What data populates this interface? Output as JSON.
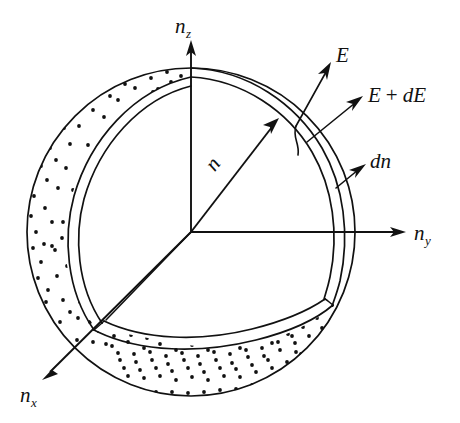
{
  "figure": {
    "background_color": "#ffffff",
    "ink_color": "#111111"
  },
  "axes": [
    {
      "id": "nz",
      "base": "n",
      "subscript": "z",
      "direction": "up",
      "label_x": 189,
      "label_y": 30
    },
    {
      "id": "ny",
      "base": "n",
      "subscript": "y",
      "direction": "right",
      "label_x": 413,
      "label_y": 239
    },
    {
      "id": "nx",
      "base": "n",
      "subscript": "x",
      "direction": "down-left",
      "label_x": 22,
      "label_y": 400
    }
  ],
  "annotations": [
    {
      "id": "radius",
      "text": "n",
      "kind": "radius-vector-label",
      "rotation_deg": -52,
      "x": 218,
      "y": 168
    },
    {
      "id": "energy",
      "text": "E",
      "kind": "shell-inner-energy",
      "x": 340,
      "y": 62
    },
    {
      "id": "energy-plus-de",
      "text": "E + dE",
      "text_parts": [
        "E",
        "+",
        "dE"
      ],
      "kind": "shell-outer-energy",
      "x": 370,
      "y": 101
    },
    {
      "id": "shell-thickness",
      "text": "dn",
      "kind": "shell-thickness",
      "x": 372,
      "y": 167
    }
  ],
  "geometry": {
    "sphere_center_x": 191,
    "sphere_center_y": 232,
    "sphere_radius_px": 164,
    "shell_thickness_px": 9,
    "stipple_dot_radius_px": 1.9,
    "stipple_dot_count": 330
  },
  "caption": ""
}
